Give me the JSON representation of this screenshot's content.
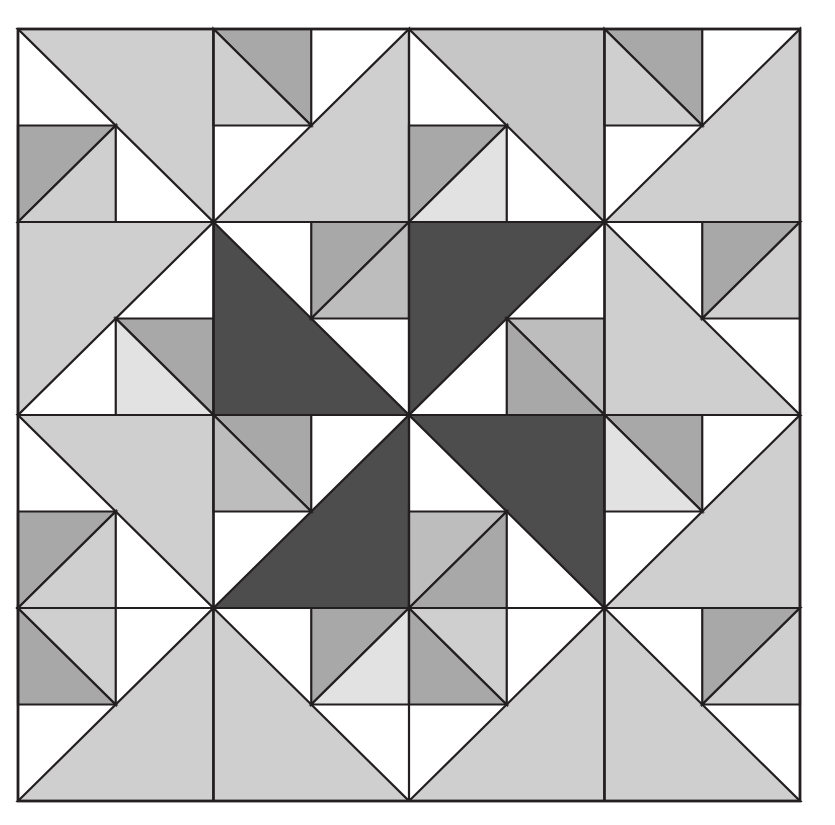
{
  "artwork": {
    "title": "Pinwheel Half-Square Triangle Quilt",
    "type": "geometric-quilt-pattern",
    "grid_rows": 4,
    "grid_cols": 4,
    "canvas_width": 835,
    "canvas_height": 825,
    "quilt_x": 18,
    "quilt_y": 29,
    "quilt_width": 782,
    "quilt_height": 772,
    "background": "#ffffff",
    "stroke": "#231f20",
    "stroke_width": 2.2
  },
  "palette": {
    "white": "#eeeeee",
    "near_white": "#e2e2e2",
    "light": "#cfcfcf",
    "light2": "#c6c6c6",
    "mid_light": "#bdbdbd",
    "mid": "#a8a8a8",
    "mid_dark": "#9a9a9a",
    "dark": "#4d4d4d",
    "darker": "#474747"
  },
  "blocks": [
    {
      "row": 0,
      "col": 0,
      "diag": "main",
      "solid_side": "upper",
      "solid": "#cfcfcf",
      "split_corner": "#a8a8a8",
      "split_edge": "#cfcfcf",
      "corner_at": "bottom"
    },
    {
      "row": 0,
      "col": 1,
      "diag": "anti",
      "solid_side": "lower",
      "solid": "#cfcfcf",
      "split_corner": "#a8a8a8",
      "split_edge": "#cfcfcf",
      "corner_at": "left"
    },
    {
      "row": 0,
      "col": 2,
      "diag": "main",
      "solid_side": "upper",
      "solid": "#c6c6c6",
      "split_corner": "#a8a8a8",
      "split_edge": "#e2e2e2",
      "corner_at": "bottom"
    },
    {
      "row": 0,
      "col": 3,
      "diag": "anti",
      "solid_side": "lower",
      "solid": "#cfcfcf",
      "split_corner": "#a8a8a8",
      "split_edge": "#cfcfcf",
      "corner_at": "left"
    },
    {
      "row": 1,
      "col": 0,
      "diag": "anti",
      "solid_side": "upper",
      "solid": "#cfcfcf",
      "split_corner": "#a8a8a8",
      "split_edge": "#e2e2e2",
      "corner_at": "right"
    },
    {
      "row": 1,
      "col": 1,
      "diag": "main",
      "solid_side": "lower",
      "solid": "#4d4d4d",
      "split_corner": "#a8a8a8",
      "split_edge": "#bdbdbd",
      "corner_at": "right"
    },
    {
      "row": 1,
      "col": 2,
      "diag": "anti",
      "solid_side": "upper",
      "solid": "#4d4d4d",
      "split_corner": "#bdbdbd",
      "split_edge": "#a8a8a8",
      "corner_at": "right"
    },
    {
      "row": 1,
      "col": 3,
      "diag": "main",
      "solid_side": "lower",
      "solid": "#cfcfcf",
      "split_corner": "#a8a8a8",
      "split_edge": "#cfcfcf",
      "corner_at": "top"
    },
    {
      "row": 2,
      "col": 0,
      "diag": "main",
      "solid_side": "upper",
      "solid": "#cfcfcf",
      "split_corner": "#a8a8a8",
      "split_edge": "#cfcfcf",
      "corner_at": "bottom"
    },
    {
      "row": 2,
      "col": 1,
      "diag": "anti",
      "solid_side": "lower",
      "solid": "#4d4d4d",
      "split_corner": "#a8a8a8",
      "split_edge": "#bdbdbd",
      "corner_at": "left"
    },
    {
      "row": 2,
      "col": 2,
      "diag": "main",
      "solid_side": "upper",
      "solid": "#4d4d4d",
      "split_corner": "#bdbdbd",
      "split_edge": "#a8a8a8",
      "corner_at": "bottom"
    },
    {
      "row": 2,
      "col": 3,
      "diag": "anti",
      "solid_side": "lower",
      "solid": "#cfcfcf",
      "split_corner": "#a8a8a8",
      "split_edge": "#e2e2e2",
      "corner_at": "left"
    },
    {
      "row": 3,
      "col": 0,
      "diag": "anti",
      "solid_side": "lower",
      "solid": "#cfcfcf",
      "split_corner": "#a8a8a8",
      "split_edge": "#cfcfcf",
      "corner_at": "right"
    },
    {
      "row": 3,
      "col": 1,
      "diag": "main",
      "solid_side": "lower",
      "solid": "#cfcfcf",
      "split_corner": "#a8a8a8",
      "split_edge": "#e2e2e2",
      "corner_at": "top"
    },
    {
      "row": 3,
      "col": 2,
      "diag": "anti",
      "solid_side": "lower",
      "solid": "#cfcfcf",
      "split_corner": "#a8a8a8",
      "split_edge": "#cfcfcf",
      "corner_at": "right"
    },
    {
      "row": 3,
      "col": 3,
      "diag": "main",
      "solid_side": "lower",
      "solid": "#cfcfcf",
      "split_corner": "#a8a8a8",
      "split_edge": "#cfcfcf",
      "corner_at": "top"
    }
  ]
}
